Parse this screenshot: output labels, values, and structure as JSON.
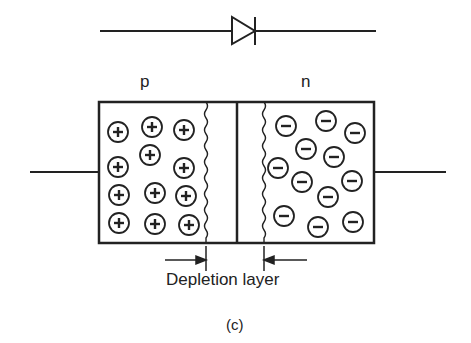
{
  "diagram": {
    "symbol": "diode-symbol",
    "labels": {
      "p_region": "p",
      "n_region": "n",
      "depletion": "Depletion layer",
      "caption": "(c)"
    },
    "p_charges": [
      [
        118,
        132
      ],
      [
        152,
        127
      ],
      [
        184,
        130
      ],
      [
        150,
        155
      ],
      [
        118,
        167
      ],
      [
        184,
        168
      ],
      [
        119,
        195
      ],
      [
        155,
        193
      ],
      [
        186,
        196
      ],
      [
        119,
        223
      ],
      [
        155,
        224
      ],
      [
        189,
        225
      ]
    ],
    "n_charges": [
      [
        286,
        126
      ],
      [
        326,
        121
      ],
      [
        355,
        133
      ],
      [
        306,
        149
      ],
      [
        334,
        157
      ],
      [
        278,
        168
      ],
      [
        302,
        182
      ],
      [
        352,
        181
      ],
      [
        328,
        197
      ],
      [
        284,
        216
      ],
      [
        318,
        227
      ],
      [
        353,
        222
      ],
      [
        351,
        213
      ]
    ],
    "colors": {
      "ink": "#222222",
      "background": "#ffffff"
    }
  }
}
